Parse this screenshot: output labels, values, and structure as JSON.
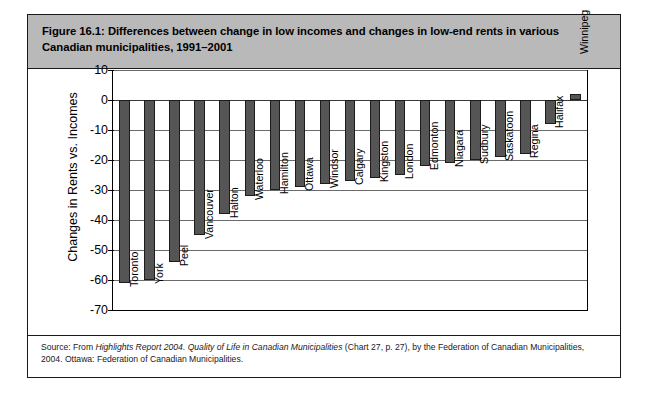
{
  "figure": {
    "title": "Figure 16.1: Differences between change in low incomes and changes in low-end rents in various Canadian municipalities, 1991–2001",
    "source_prefix": "Source: From ",
    "source_italic_1": "Highlights Report 2004. Quality of Life in Canadian Municipalities",
    "source_mid": " (Chart 27, p. 27), by the Federation of Canadian Municipalities, 2004. Ottawa: Federation of Canadian Municipalities.",
    "frame_border_color": "#1a1a1a",
    "title_band_color": "#b9b9b9"
  },
  "chart_data": {
    "type": "bar",
    "title": "",
    "xlabel": "",
    "ylabel": "Changes in Rents vs. Incomes",
    "ylim": [
      -70,
      10
    ],
    "yticks": [
      10,
      0,
      -10,
      -20,
      -30,
      -40,
      -50,
      -60,
      -70
    ],
    "ytick_labels": [
      "10",
      "0",
      "-10",
      "-20",
      "-30",
      "-40",
      "-50",
      "-60",
      "-70"
    ],
    "grid": true,
    "legend": "none",
    "bar_color": "#555555",
    "bar_edge_color": "#1c1c1c",
    "categories": [
      "Toronto",
      "York",
      "Peel",
      "Vancouver",
      "Halton",
      "Waterloo",
      "Hamilton",
      "Ottawa",
      "Windsor",
      "Calgary",
      "Kingston",
      "London",
      "Edmonton",
      "Niagara",
      "Sudbury",
      "Saskatoon",
      "Regina",
      "Halifax",
      "Winnipeg"
    ],
    "values": [
      -61,
      -60,
      -54,
      -45,
      -38,
      -32,
      -30,
      -29,
      -28,
      -27,
      -26,
      -25,
      -22,
      -21,
      -20,
      -19,
      -18,
      -8,
      2
    ]
  }
}
